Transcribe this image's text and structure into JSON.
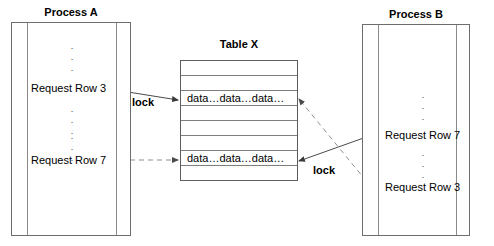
{
  "diagram": {
    "title_process_a": "Process A",
    "title_process_b": "Process B",
    "title_table": "Table X",
    "ellipsis": "·\n·\n·",
    "process_a": {
      "requests": [
        {
          "label": "Request Row 3"
        },
        {
          "label": "Request Row 7"
        }
      ]
    },
    "process_b": {
      "requests": [
        {
          "label": "Request Row 7"
        },
        {
          "label": "Request Row 3"
        }
      ]
    },
    "table": {
      "rows": [
        {
          "text": ""
        },
        {
          "text": ""
        },
        {
          "text": "data…data…data…"
        },
        {
          "text": ""
        },
        {
          "text": ""
        },
        {
          "text": ""
        },
        {
          "text": "data…data…data…"
        },
        {
          "text": ""
        }
      ]
    },
    "connectors": {
      "lock_left_label": "lock",
      "lock_right_label": "lock"
    },
    "colors": {
      "box_stroke": "#6d6d6d",
      "table_stroke": "#5d5d5d",
      "line_solid": "#4a4a4a",
      "line_dashed": "#8f8f8f",
      "text": "#000000",
      "background": "#ffffff"
    }
  }
}
